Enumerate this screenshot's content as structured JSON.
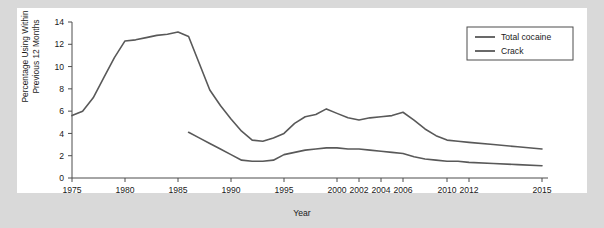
{
  "chart_data": {
    "type": "line",
    "title": "",
    "xlabel": "Year",
    "ylabel": "Percentage Using Within\nPrevious 12 Months",
    "ylim": [
      0,
      14
    ],
    "yticks": [
      0,
      2,
      4,
      6,
      8,
      10,
      12,
      14
    ],
    "xticks": [
      1975,
      1980,
      1985,
      1990,
      1995,
      2000,
      2002,
      2004,
      2006,
      2010,
      2012,
      2015
    ],
    "xtick_labels": [
      "1975",
      "1980",
      "1985",
      "1990",
      "1995",
      "2000",
      "2002",
      "2004",
      "2006",
      "2010",
      "2012",
      "2015"
    ],
    "grid": false,
    "legend_position": "upper right",
    "series": [
      {
        "name": "Total cocaine",
        "color": "#595959",
        "x": [
          1975,
          1976,
          1977,
          1978,
          1979,
          1980,
          1981,
          1982,
          1983,
          1984,
          1985,
          1986,
          1987,
          1988,
          1989,
          1990,
          1991,
          1992,
          1993,
          1994,
          1995,
          1996,
          1997,
          1998,
          1999,
          2000,
          2001,
          2002,
          2003,
          2004,
          2005,
          2006,
          2007,
          2008,
          2009,
          2010,
          2011,
          2012,
          2013,
          2014,
          2015
        ],
        "values": [
          5.6,
          6.0,
          7.2,
          9.0,
          10.8,
          12.3,
          12.4,
          12.6,
          12.8,
          12.9,
          13.1,
          12.7,
          10.3,
          7.9,
          6.5,
          5.3,
          4.2,
          3.4,
          3.3,
          3.6,
          4.0,
          4.9,
          5.5,
          5.7,
          6.2,
          5.8,
          5.4,
          5.2,
          5.4,
          5.5,
          5.6,
          5.9,
          5.2,
          4.4,
          3.8,
          3.4,
          3.3,
          3.2,
          3.0,
          2.8,
          2.6
        ]
      },
      {
        "name": "Crack",
        "color": "#595959",
        "x": [
          1986,
          1987,
          1988,
          1989,
          1990,
          1991,
          1992,
          1993,
          1994,
          1995,
          1996,
          1997,
          1998,
          1999,
          2000,
          2001,
          2002,
          2003,
          2004,
          2005,
          2006,
          2007,
          2008,
          2009,
          2010,
          2011,
          2012,
          2013,
          2014,
          2015
        ],
        "values": [
          4.1,
          3.6,
          3.1,
          2.6,
          2.1,
          1.6,
          1.5,
          1.5,
          1.6,
          2.1,
          2.3,
          2.5,
          2.6,
          2.7,
          2.7,
          2.6,
          2.6,
          2.5,
          2.4,
          2.3,
          2.2,
          1.9,
          1.7,
          1.6,
          1.5,
          1.5,
          1.4,
          1.3,
          1.2,
          1.1
        ]
      }
    ]
  },
  "legend": {
    "entries": [
      {
        "label": "Total cocaine"
      },
      {
        "label": "Crack"
      }
    ]
  },
  "axis": {
    "y_title": "Percentage Using Within\nPrevious 12 Months",
    "x_title": "Year"
  },
  "colors": {
    "background": "#d9d9d9",
    "panel": "#ffffff",
    "line": "#595959",
    "axis": "#4d4d4d",
    "text": "#1a1a1a"
  }
}
